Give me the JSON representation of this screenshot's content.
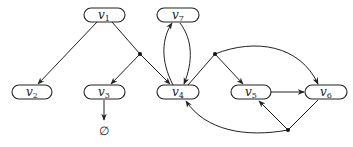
{
  "diagram": {
    "type": "directed hypergraph",
    "colors": {
      "stroke": "#222222",
      "background": "#ffffff"
    },
    "nodes": [
      {
        "id": "v1",
        "base": "v",
        "sub": "1",
        "x": 104,
        "y": 15
      },
      {
        "id": "v7",
        "base": "v",
        "sub": "7",
        "x": 178,
        "y": 15
      },
      {
        "id": "v2",
        "base": "v",
        "sub": "2",
        "x": 32,
        "y": 92
      },
      {
        "id": "v3",
        "base": "v",
        "sub": "3",
        "x": 104,
        "y": 92
      },
      {
        "id": "v4",
        "base": "v",
        "sub": "4",
        "x": 178,
        "y": 92
      },
      {
        "id": "v5",
        "base": "v",
        "sub": "5",
        "x": 251,
        "y": 92
      },
      {
        "id": "v6",
        "base": "v",
        "sub": "6",
        "x": 328,
        "y": 92
      }
    ],
    "empty_set": {
      "symbol": "∅",
      "x": 104,
      "y": 132
    },
    "junctions": [
      {
        "id": "j1",
        "x": 140,
        "y": 54
      },
      {
        "id": "j2",
        "x": 215,
        "y": 54
      },
      {
        "id": "j3",
        "x": 288,
        "y": 130
      }
    ],
    "edges": [
      {
        "from": "v1",
        "to": "v2"
      },
      {
        "from": "v1",
        "via": "j1",
        "to": [
          "v3",
          "v4"
        ]
      },
      {
        "from": "v3",
        "to": "∅"
      },
      {
        "from": "v4",
        "to": "v7"
      },
      {
        "from": "v7",
        "to": "v4"
      },
      {
        "from": "v4",
        "via": "j2",
        "to": [
          "v5",
          "v6"
        ]
      },
      {
        "from": "v5",
        "to": "v6"
      },
      {
        "from": "v6",
        "via": "j3",
        "to": [
          "v5",
          "v4"
        ]
      }
    ]
  }
}
